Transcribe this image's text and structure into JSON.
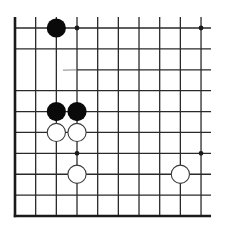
{
  "diagram": {
    "type": "go-board-fragment",
    "colors": {
      "line": "#2a2a2a",
      "edge": "#1a1a1a",
      "black_stone": "#0a0a0a",
      "white_stone_fill": "#ffffff",
      "white_stone_stroke": "#3a3a3a",
      "background": "#ffffff",
      "scratch": "#6a6a6a"
    },
    "grid": {
      "columns": 10,
      "rows": 10,
      "x0": 15,
      "y0": 28,
      "spacing_x": 20.67,
      "spacing_y": 20.89,
      "left_edge_thick": true,
      "bottom_edge_thick": true,
      "open_top": true,
      "open_right": true,
      "missing_segments": [
        {
          "row": 2,
          "from_col": 0,
          "to_col": 3,
          "note": "horizontal line absent / faded"
        }
      ]
    },
    "star_points": [
      {
        "col": 3,
        "row": 0
      },
      {
        "col": 9,
        "row": 0
      },
      {
        "col": 3,
        "row": 6
      },
      {
        "col": 9,
        "row": 6
      }
    ],
    "stones": [
      {
        "color": "black",
        "col": 2,
        "row": 0
      },
      {
        "color": "black",
        "col": 2,
        "row": 4
      },
      {
        "color": "black",
        "col": 3,
        "row": 4
      },
      {
        "color": "white",
        "col": 2,
        "row": 5
      },
      {
        "color": "white",
        "col": 3,
        "row": 5
      },
      {
        "color": "white",
        "col": 3,
        "row": 7
      },
      {
        "color": "white",
        "col": 8,
        "row": 7
      }
    ],
    "stone_radius": 9.6,
    "star_radius": 2.4
  }
}
